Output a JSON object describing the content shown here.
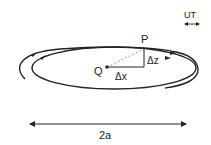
{
  "diagram": {
    "labels": {
      "point_p": "P",
      "point_q": "Q",
      "delta_x": "Δx",
      "delta_z": "Δz",
      "major_axis": "2a",
      "time_unit": "UT"
    },
    "colors": {
      "stroke": "#222222",
      "dashed": "#999999",
      "background": "#ffffff"
    }
  }
}
